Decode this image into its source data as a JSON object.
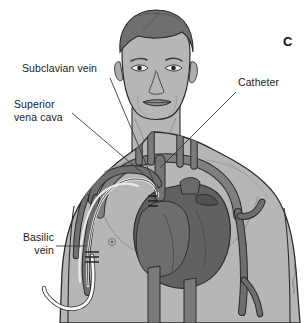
{
  "figure": {
    "panel_letter": "C",
    "kind": "anatomical-illustration",
    "background_color": "#ffffff",
    "palette": {
      "skin": "#b6b6b6",
      "skin_shadow": "#a0a0a0",
      "hair": "#6f6f6f",
      "vessel": "#7a7a7a",
      "vessel_dark": "#5e5e5e",
      "heart": "#616161",
      "heart_dark": "#515151",
      "outline": "#2b2b2b",
      "leader_line": "#3a3a3a",
      "catheter": "#f2f2f2",
      "label_text": "#1a1a1a"
    }
  },
  "labels": {
    "subclavian_vein": "Subclavian vein",
    "superior_vena_cava_line1": "Superior",
    "superior_vena_cava_line2": "vena cava",
    "basilic_vein_line1": "Basilic",
    "basilic_vein_line2": "vein",
    "catheter": "Catheter"
  },
  "anatomy": {
    "structures": [
      "head",
      "neck",
      "torso",
      "left shoulder",
      "right shoulder",
      "heart",
      "aortic arch",
      "superior vena cava",
      "subclavian veins",
      "jugular vessels",
      "basilic vein",
      "catheter tubing"
    ],
    "nipple_markers": 2,
    "neck_vessel_count": 4
  }
}
